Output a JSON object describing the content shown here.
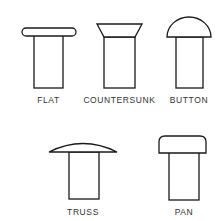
{
  "diagram": {
    "rivets": [
      {
        "id": "flat",
        "label": "FLAT"
      },
      {
        "id": "countersunk",
        "label": "COUNTERSUNK"
      },
      {
        "id": "button",
        "label": "BUTTON"
      },
      {
        "id": "truss",
        "label": "TRUSS"
      },
      {
        "id": "pan",
        "label": "PAN"
      }
    ],
    "colors": {
      "stroke": "#1a1a1a",
      "background": "#ffffff",
      "label": "#333333"
    }
  }
}
